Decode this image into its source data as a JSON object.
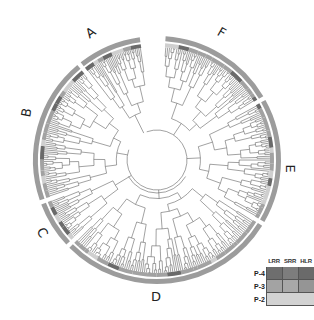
{
  "figure": {
    "type": "circular-phylogenetic-tree",
    "center": [
      157,
      160
    ],
    "outer_ring_radius": 124,
    "inner_ring_radius": 117,
    "tip_radius": 113,
    "root_circle_radius": 30,
    "colors": {
      "branch": "#555555",
      "outer_ring": "#9c9c9c",
      "P-4": "#6a6a6a",
      "P-3": "#a2a2a2",
      "P-2": "#cfcfcf"
    }
  },
  "clades": [
    {
      "label": "A",
      "start_deg": -128,
      "end_deg": -98,
      "leaves": 34,
      "label_pos": [
        86,
        26
      ],
      "label_rot": -35
    },
    {
      "label": "F",
      "start_deg": -86,
      "end_deg": -31,
      "leaves": 58,
      "label_pos": [
        218,
        26
      ],
      "label_rot": 30
    },
    {
      "label": "E",
      "start_deg": -29,
      "end_deg": 30,
      "leaves": 62,
      "label_pos": [
        286,
        162
      ],
      "label_rot": 90
    },
    {
      "label": "D",
      "start_deg": 32,
      "end_deg": 135,
      "leaves": 100,
      "label_pos": [
        151,
        290
      ],
      "label_rot": 0
    },
    {
      "label": "C",
      "start_deg": 137,
      "end_deg": 159,
      "leaves": 24,
      "label_pos": [
        38,
        226
      ],
      "label_rot": 60
    },
    {
      "label": "B",
      "start_deg": 161,
      "end_deg": 230,
      "leaves": 70,
      "label_pos": [
        22,
        106
      ],
      "label_rot": -80
    }
  ],
  "legend": {
    "columns": [
      "LRR",
      "SRR",
      "HLR"
    ],
    "rows": [
      {
        "label": "P-4",
        "cells": [
          "#6e6e6e",
          "#7d7d7d",
          "#6a6a6a"
        ],
        "merged": false
      },
      {
        "label": "P-3",
        "cells": [
          "#a3a3a3",
          "#a8a8a8",
          "#959595"
        ],
        "merged": false
      },
      {
        "label": "P-2",
        "cells": [
          "#d2d2d2"
        ],
        "merged": true
      }
    ]
  }
}
